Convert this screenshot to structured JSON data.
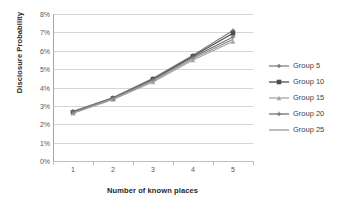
{
  "chart_data": {
    "type": "line",
    "title": "",
    "xlabel": "Number of known places",
    "ylabel": "Disclosure Probability",
    "categories": [
      "1",
      "2",
      "3",
      "4",
      "5"
    ],
    "x": [
      1,
      2,
      3,
      4,
      5
    ],
    "ylim": [
      0,
      8
    ],
    "ytick_labels": [
      "0%",
      "1%",
      "2%",
      "3%",
      "4%",
      "5%",
      "6%",
      "7%",
      "8%"
    ],
    "ytick_values": [
      0,
      1,
      2,
      3,
      4,
      5,
      6,
      7,
      8
    ],
    "xtick_labels": [
      "1",
      "2",
      "3",
      "4",
      "5"
    ],
    "grid": "horizontal",
    "legend_position": "right",
    "series": [
      {
        "name": "Group 5",
        "values": [
          2.7,
          3.45,
          4.5,
          5.75,
          7.1
        ],
        "color": "#808080",
        "marker": "diamond"
      },
      {
        "name": "Group 10",
        "values": [
          2.65,
          3.4,
          4.45,
          5.7,
          6.95
        ],
        "color": "#4d4d4d",
        "marker": "square"
      },
      {
        "name": "Group 15",
        "values": [
          2.6,
          3.35,
          4.3,
          5.5,
          6.5
        ],
        "color": "#a6a6a6",
        "marker": "triangle"
      },
      {
        "name": "Group 20",
        "values": [
          2.68,
          3.42,
          4.42,
          5.65,
          6.75
        ],
        "color": "#737373",
        "marker": "cross"
      },
      {
        "name": "Group 25",
        "values": [
          2.62,
          3.38,
          4.35,
          5.58,
          6.62
        ],
        "color": "#999999",
        "marker": "none"
      }
    ]
  }
}
